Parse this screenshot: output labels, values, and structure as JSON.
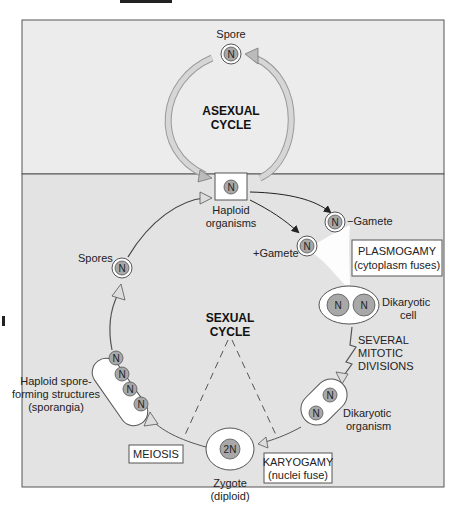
{
  "colors": {
    "asexual_bg": "#ececec",
    "sexual_bg": "#e3e3e3",
    "border": "#555555",
    "cell_fill": "#ffffff",
    "nucleus_fill": "#a8a8a8",
    "arrow_fill": "#c8c8c8"
  },
  "asexual": {
    "title_line1": "ASEXUAL",
    "title_line2": "CYCLE",
    "spore_label": "Spore",
    "spore_nucleus": "N"
  },
  "haploid": {
    "nucleus": "N",
    "label_line1": "Haploid",
    "label_line2": "organisms"
  },
  "sexual": {
    "title_line1": "SEXUAL",
    "title_line2": "CYCLE",
    "minus_gamete": "−Gamete",
    "plus_gamete": "+Gamete",
    "gamete_nucleus": "N",
    "plasmogamy_line1": "PLASMOGAMY",
    "plasmogamy_line2": "(cytoplasm fuses)",
    "dikaryotic_cell_line1": "Dikaryotic",
    "dikaryotic_cell_line2": "cell",
    "mitotic_line1": "SEVERAL",
    "mitotic_line2": "MITOTIC",
    "mitotic_line3": "DIVISIONS",
    "dikaryotic_org_line1": "Dikaryotic",
    "dikaryotic_org_line2": "organism",
    "karyogamy_line1": "KARYOGAMY",
    "karyogamy_line2": "(nuclei fuse)",
    "zygote_nucleus": "2N",
    "zygote_line1": "Zygote",
    "zygote_line2": "(diploid)",
    "meiosis": "MEIOSIS",
    "sporangia_line1": "Haploid spore-",
    "sporangia_line2": "forming structures",
    "sporangia_line3": "(sporangia)",
    "spores_label": "Spores",
    "nucleus": "N"
  }
}
